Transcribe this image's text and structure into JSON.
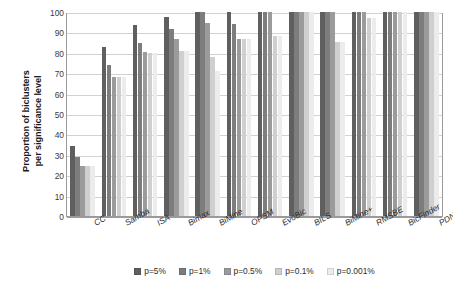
{
  "chart_data": {
    "type": "bar",
    "title": "",
    "xlabel": "",
    "ylabel": "Proportion of biclusters per significance level",
    "ylabel_line1": "Proportion of biclusters",
    "ylabel_line2": "per significance level",
    "ylim": [
      0,
      100
    ],
    "ytick_step": 10,
    "yticks": [
      0,
      10,
      20,
      30,
      40,
      50,
      60,
      70,
      80,
      90,
      100
    ],
    "grid": true,
    "legend_position": "bottom",
    "categories": [
      "CC",
      "Samba",
      "ISA",
      "Bimax",
      "BiMine",
      "OPSM",
      "EvoBic",
      "BILS",
      "BiMine+",
      "RMSBE",
      "BicFinder",
      "PDNS"
    ],
    "series": [
      {
        "name": "p=5%",
        "color": "#5f5f5f",
        "values": [
          34.5,
          83,
          93.5,
          97.5,
          100,
          100,
          100,
          100,
          100,
          100,
          100,
          100
        ]
      },
      {
        "name": "p=1%",
        "color": "#7d7d7d",
        "values": [
          29,
          74,
          85,
          91.5,
          100,
          94,
          100,
          100,
          100,
          100,
          100,
          100
        ]
      },
      {
        "name": "p=0.5%",
        "color": "#9b9b9b",
        "values": [
          24.5,
          68,
          80.5,
          87,
          94.5,
          87,
          100,
          100,
          100,
          100,
          100,
          100
        ]
      },
      {
        "name": "p=0.1%",
        "color": "#cfcfcf",
        "values": [
          24.5,
          68,
          80,
          81,
          78,
          87,
          88,
          100,
          85.5,
          97,
          100,
          100
        ]
      },
      {
        "name": "p=0.001%",
        "color": "#ececec",
        "values": [
          24.5,
          68,
          80,
          81,
          71,
          87,
          88,
          100,
          85.5,
          97,
          100,
          100
        ]
      }
    ]
  }
}
